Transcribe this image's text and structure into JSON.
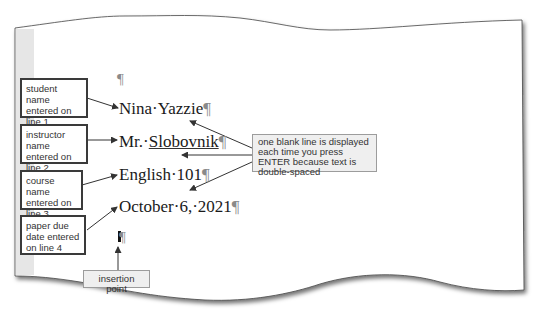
{
  "document": {
    "blank_paragraph_mark": "¶",
    "lines": [
      {
        "text": "Nina·Yazzie",
        "mark": "¶"
      },
      {
        "prefix": "Mr.·",
        "name": "Slobovnik",
        "mark": "¶"
      },
      {
        "text": "English·101",
        "mark": "¶"
      },
      {
        "text": "October·6,·2021",
        "mark": "¶"
      }
    ],
    "cursor_mark": "¶"
  },
  "callouts": {
    "line1": "student name entered on line 1",
    "line2": "instructor name entered on line 2",
    "line3": "course name entered on line 3",
    "line4": "paper due date entered on line 4",
    "insertion_point": "insertion point",
    "double_spaced_note": "one blank line is displayed each time you press ENTER because text is double-spaced"
  },
  "colors": {
    "callout_border": "#3a3a3a",
    "note_background": "#efefef",
    "margin_bar": "#e6e6e6",
    "arrow": "#333333"
  }
}
